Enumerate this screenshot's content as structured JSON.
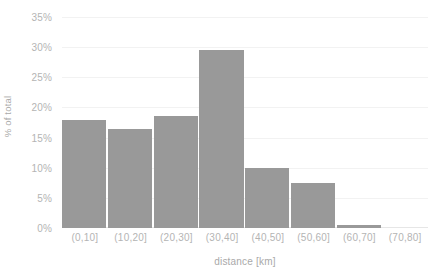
{
  "chart_data": {
    "type": "bar",
    "title": "",
    "subtitle": "",
    "xlabel": "distance [km]",
    "ylabel": "% of total",
    "categories": [
      "(0,10]",
      "(10,20]",
      "(20,30]",
      "(30,40]",
      "(40,50]",
      "(50,60]",
      "(60,70]",
      "(70,80]"
    ],
    "values": [
      18.0,
      16.5,
      18.5,
      29.5,
      10.0,
      7.5,
      0.5,
      0.0
    ],
    "value_labels": [
      "18%",
      "16.5%",
      "18.5%",
      "29.5%",
      "10%",
      "7.5%",
      "0.5%",
      "0%"
    ],
    "ylim": [
      0,
      35
    ],
    "xlim_note": "categorical",
    "y_ticks": [
      0,
      5,
      10,
      15,
      20,
      25,
      30,
      35
    ],
    "y_tick_labels": [
      "0%",
      "5%",
      "10%",
      "15%",
      "20%",
      "25%",
      "30%",
      "35%"
    ],
    "grid": "horizontal",
    "legend": "none",
    "legend_position": "none",
    "series": [
      {
        "name": "% of total",
        "values": [
          18.0,
          16.5,
          18.5,
          29.5,
          10.0,
          7.5,
          0.5,
          0.0
        ]
      }
    ],
    "colors": {
      "bar": "#999999",
      "gridline": "#f2f2f2",
      "baseline": "#e6e6e6",
      "tick_label": "#b4b4b4",
      "axis_title": "#a9a9a9",
      "background": "#ffffff"
    }
  }
}
